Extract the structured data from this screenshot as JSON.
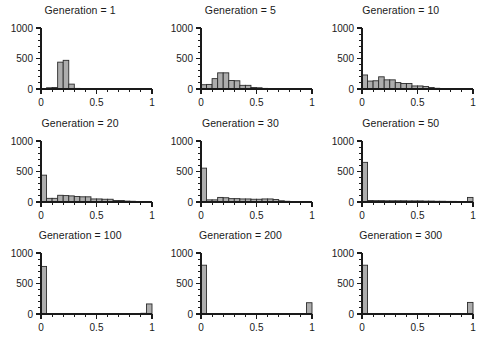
{
  "figure": {
    "title": "",
    "rows": 3,
    "columns": 3,
    "bar_color": "#adadad",
    "bar_edge_color": "#2b2b2b",
    "axis_color": "#1a1a1a",
    "background": "#ffffff"
  },
  "chart_data": {
    "type": "bar",
    "title": "",
    "xlabel": "",
    "ylabel": "",
    "xlim": [
      0,
      1
    ],
    "ylim": [
      0,
      1000
    ],
    "xticks": [
      0,
      0.1,
      0.2,
      0.3,
      0.4,
      0.5,
      0.6,
      0.7,
      0.8,
      0.9,
      1
    ],
    "xtick_labels": [
      "0",
      "",
      "",
      "",
      "",
      "0.5",
      "",
      "",
      "",
      "",
      "1"
    ],
    "yticks": [
      0,
      100,
      200,
      300,
      400,
      500,
      600,
      700,
      800,
      900,
      1000
    ],
    "ytick_labels": [
      "0",
      "",
      "",
      "",
      "",
      "500",
      "",
      "",
      "",
      "",
      "1000"
    ],
    "grid": false,
    "legend": false,
    "bin_width": 0.05,
    "panels": [
      {
        "title": "Generation = 1",
        "generation": 1,
        "bin_edges": [
          0.05,
          0.1,
          0.15,
          0.2,
          0.25,
          0.3,
          0.35,
          0.4
        ],
        "values": [
          20,
          25,
          440,
          470,
          80,
          10,
          5
        ]
      },
      {
        "title": "Generation = 5",
        "generation": 5,
        "bin_edges": [
          0.0,
          0.05,
          0.1,
          0.15,
          0.2,
          0.25,
          0.3,
          0.35,
          0.4,
          0.45,
          0.5,
          0.55,
          0.6,
          0.65
        ],
        "values": [
          70,
          75,
          170,
          265,
          265,
          140,
          135,
          60,
          60,
          25,
          20,
          10,
          5
        ]
      },
      {
        "title": "Generation = 10",
        "generation": 10,
        "bin_edges": [
          0.0,
          0.05,
          0.1,
          0.15,
          0.2,
          0.25,
          0.3,
          0.35,
          0.4,
          0.45,
          0.5,
          0.55,
          0.6,
          0.65,
          0.7,
          0.75
        ],
        "values": [
          230,
          130,
          135,
          200,
          150,
          150,
          105,
          90,
          90,
          50,
          50,
          40,
          25,
          12,
          6
        ]
      },
      {
        "title": "Generation = 20",
        "generation": 20,
        "bin_edges": [
          0.0,
          0.05,
          0.1,
          0.15,
          0.2,
          0.25,
          0.3,
          0.35,
          0.4,
          0.45,
          0.5,
          0.55,
          0.6,
          0.65,
          0.7,
          0.75,
          0.8,
          0.85
        ],
        "values": [
          440,
          60,
          60,
          110,
          105,
          100,
          90,
          85,
          85,
          50,
          50,
          45,
          45,
          25,
          25,
          15,
          12
        ]
      },
      {
        "title": "Generation = 30",
        "generation": 30,
        "bin_edges": [
          0.0,
          0.05,
          0.1,
          0.15,
          0.2,
          0.25,
          0.3,
          0.35,
          0.4,
          0.45,
          0.5,
          0.55,
          0.6,
          0.65,
          0.7,
          0.75,
          0.8,
          0.85,
          0.9
        ],
        "values": [
          555,
          35,
          35,
          75,
          70,
          55,
          55,
          50,
          50,
          45,
          45,
          50,
          50,
          40,
          20,
          12,
          8,
          5
        ]
      },
      {
        "title": "Generation = 50",
        "generation": 50,
        "bin_edges": [
          0.0,
          0.05,
          0.1,
          0.15,
          0.2,
          0.25,
          0.3,
          0.35,
          0.4,
          0.45,
          0.5,
          0.55,
          0.6,
          0.65,
          0.7,
          0.75,
          0.8,
          0.85,
          0.9,
          0.95,
          1.0
        ],
        "values": [
          650,
          25,
          22,
          22,
          20,
          20,
          20,
          20,
          18,
          18,
          18,
          15,
          15,
          12,
          12,
          10,
          10,
          8,
          8,
          75
        ]
      },
      {
        "title": "Generation = 100",
        "generation": 100,
        "bin_edges": [
          0.0,
          0.05,
          0.1,
          0.15,
          0.2,
          0.25,
          0.3,
          0.35,
          0.4,
          0.45,
          0.5,
          0.55,
          0.6,
          0.65,
          0.7,
          0.75,
          0.8,
          0.85,
          0.9,
          0.95,
          1.0
        ],
        "values": [
          780,
          8,
          6,
          6,
          6,
          6,
          5,
          5,
          5,
          5,
          5,
          5,
          5,
          5,
          5,
          5,
          5,
          5,
          12,
          165
        ]
      },
      {
        "title": "Generation = 200",
        "generation": 200,
        "bin_edges": [
          0.0,
          0.05,
          0.1,
          0.15,
          0.2,
          0.25,
          0.3,
          0.35,
          0.4,
          0.45,
          0.5,
          0.55,
          0.6,
          0.65,
          0.7,
          0.75,
          0.8,
          0.85,
          0.9,
          0.95,
          1.0
        ],
        "values": [
          800,
          0,
          0,
          0,
          0,
          0,
          0,
          0,
          0,
          0,
          0,
          0,
          0,
          0,
          0,
          0,
          0,
          0,
          0,
          185
        ]
      },
      {
        "title": "Generation = 300",
        "generation": 300,
        "bin_edges": [
          0.0,
          0.05,
          0.1,
          0.15,
          0.2,
          0.25,
          0.3,
          0.35,
          0.4,
          0.45,
          0.5,
          0.55,
          0.6,
          0.65,
          0.7,
          0.75,
          0.8,
          0.85,
          0.9,
          0.95,
          1.0
        ],
        "values": [
          800,
          0,
          0,
          0,
          0,
          0,
          0,
          0,
          0,
          0,
          0,
          0,
          0,
          0,
          0,
          0,
          0,
          0,
          0,
          190
        ]
      }
    ]
  }
}
